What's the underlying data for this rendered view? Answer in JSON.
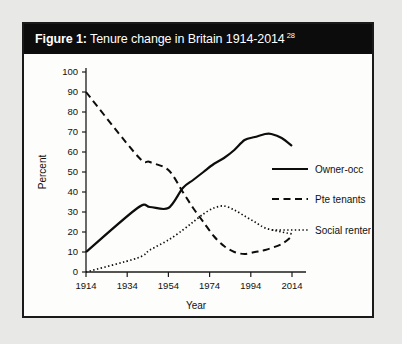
{
  "figure": {
    "title_lead": "Figure 1:",
    "title_rest": "Tenure change in Britain 1914-2014",
    "footnote_marker": "28"
  },
  "colors": {
    "title_bar_background": "#0c0c0c",
    "title_text": "#ffffff",
    "card_background": "#fdfdfb",
    "card_border": "#1a1a1a",
    "page_background": "#e8e8e6",
    "ink": "#0d0d0d"
  },
  "chart_data": {
    "type": "line",
    "title": "Tenure change in Britain 1914-2014",
    "xlabel": "Year",
    "ylabel": "Percent",
    "xlim": [
      1914,
      2014
    ],
    "ylim": [
      0,
      100
    ],
    "xticks": [
      1914,
      1934,
      1954,
      1974,
      1994,
      2014
    ],
    "yticks": [
      0,
      10,
      20,
      30,
      40,
      50,
      60,
      70,
      80,
      90,
      100
    ],
    "grid": false,
    "legend_position": "center-right",
    "series": [
      {
        "name": "Owner-occ",
        "style": "solid",
        "x": [
          1914,
          1939,
          1945,
          1954,
          1961,
          1966,
          1971,
          1976,
          1981,
          1986,
          1991,
          1996,
          2001,
          2004,
          2009,
          2014
        ],
        "values": [
          10,
          32,
          32.5,
          32,
          42,
          46,
          50,
          54,
          57,
          61,
          66,
          67.5,
          69,
          69,
          67,
          63
        ]
      },
      {
        "name": "Pte tenants",
        "style": "dashed",
        "x": [
          1914,
          1939,
          1945,
          1954,
          1961,
          1966,
          1971,
          1976,
          1981,
          1986,
          1991,
          1996,
          2001,
          2009,
          2014
        ],
        "values": [
          90,
          58,
          55,
          51,
          40,
          32,
          25,
          18,
          13,
          10,
          9,
          10,
          11,
          14,
          18
        ]
      },
      {
        "name": "Social renters",
        "style": "dotted",
        "x": [
          1914,
          1939,
          1945,
          1954,
          1961,
          1966,
          1971,
          1976,
          1981,
          1986,
          1991,
          1996,
          2001,
          2009,
          2014
        ],
        "values": [
          0,
          7,
          11,
          16,
          21,
          25,
          29,
          32,
          33,
          31,
          28,
          25,
          22,
          20,
          19
        ]
      }
    ]
  }
}
